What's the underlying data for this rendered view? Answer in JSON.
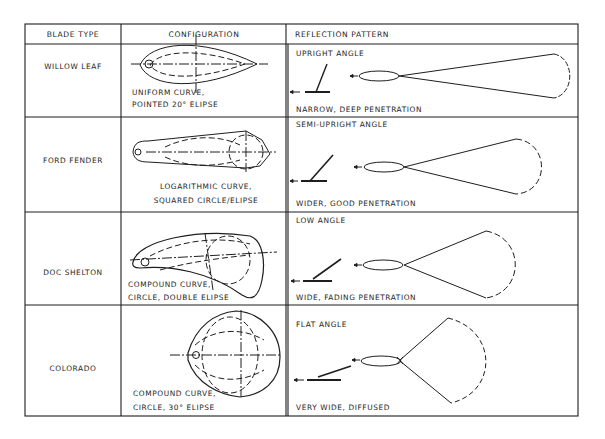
{
  "table": {
    "headers": {
      "blade_type": "BLADE TYPE",
      "configuration": "CONFIGURATION",
      "reflection_pattern": "REFLECTION PATTERN"
    },
    "rows": [
      {
        "blade_type": "WILLOW LEAF",
        "configuration_line1": "UNIFORM CURVE,",
        "configuration_line2": "POINTED 20° ELIPSE",
        "angle": "UPRIGHT ANGLE",
        "pattern": "NARROW, DEEP PENETRATION"
      },
      {
        "blade_type": "FORD FENDER",
        "configuration_line1": "LOGARITHMIC CURVE,",
        "configuration_line2": "SQUARED CIRCLE/ELIPSE",
        "angle": "SEMI-UPRIGHT ANGLE",
        "pattern": "WIDER, GOOD PENETRATION"
      },
      {
        "blade_type": "DOC SHELTON",
        "configuration_line1": "COMPOUND CURVE,",
        "configuration_line2": "CIRCLE, DOUBLE ELIPSE",
        "angle": "LOW ANGLE",
        "pattern": "WIDE, FADING PENETRATION"
      },
      {
        "blade_type": "COLORADO",
        "configuration_line1": "COMPOUND CURVE,",
        "configuration_line2": "CIRCLE, 30° ELIPSE",
        "angle": "FLAT ANGLE",
        "pattern": "VERY WIDE, DIFFUSED"
      }
    ]
  },
  "colors": {
    "ink": "#1e1e1e",
    "paper": "#ffffff"
  }
}
